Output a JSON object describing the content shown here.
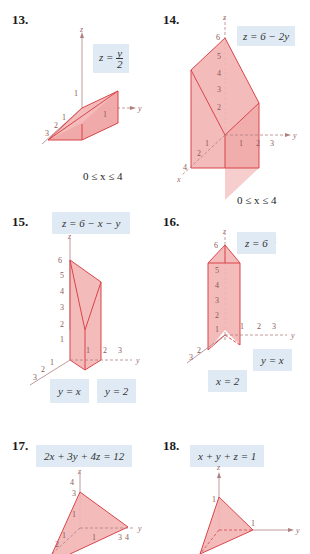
{
  "problems": [
    {
      "number": "13.",
      "equation": "z = y/2",
      "eq_lhs": "z =",
      "eq_num": "y",
      "eq_den": "2",
      "constraints": [
        "0 ≤ x ≤ 4",
        "0 ≤ y ≤ 2"
      ],
      "axes": {
        "x": "x",
        "y": "y",
        "z": "z"
      },
      "ticks": {
        "x": [
          "1",
          "2",
          "3",
          "4"
        ],
        "y": [
          "1"
        ],
        "z": [
          "1"
        ]
      }
    },
    {
      "number": "14.",
      "equation": "z = 6 − 2y",
      "constraints": [
        "0 ≤ x ≤ 4",
        "0 ≤ y ≤ 2"
      ],
      "axes": {
        "x": "x",
        "y": "y",
        "z": "z"
      },
      "ticks": {
        "x": [
          "1",
          "2",
          "4"
        ],
        "y": [
          "1",
          "2",
          "3"
        ],
        "z": [
          "2",
          "3",
          "4",
          "5",
          "6"
        ]
      }
    },
    {
      "number": "15.",
      "equation": "z = 6 − x − y",
      "labels": [
        "y = x",
        "y = 2"
      ],
      "axes": {
        "x": "x",
        "y": "y",
        "z": "z"
      },
      "ticks": {
        "x": [
          "1",
          "2",
          "3"
        ],
        "y": [
          "1",
          "2",
          "3"
        ],
        "z": [
          "1",
          "2",
          "3",
          "4",
          "5",
          "6"
        ]
      }
    },
    {
      "number": "16.",
      "equation": "z = 6",
      "labels": [
        "y = x",
        "x = 2"
      ],
      "axes": {
        "x": "x",
        "y": "y",
        "z": "z"
      },
      "ticks": {
        "x": [
          "2",
          "3"
        ],
        "y": [
          "1",
          "2",
          "3"
        ],
        "z": [
          "1",
          "2",
          "3",
          "4",
          "5",
          "6"
        ]
      }
    },
    {
      "number": "17.",
      "equation": "2x + 3y + 4z = 12",
      "axes": {
        "x": "x",
        "y": "y",
        "z": "z"
      },
      "ticks": {
        "x": [
          "1",
          "2"
        ],
        "y": [
          "1",
          "3",
          "4"
        ],
        "z": [
          "1",
          "3",
          "4"
        ]
      }
    },
    {
      "number": "18.",
      "equation": "x + y + z = 1",
      "axes": {
        "x": "x",
        "y": "y",
        "z": "z"
      },
      "ticks": {
        "x": [],
        "y": [
          "1"
        ],
        "z": [
          "1"
        ]
      }
    }
  ],
  "colors": {
    "fill": "#f3b4b4",
    "edge": "#d9454a",
    "box": "#dfeaf4",
    "axis": "#b08080"
  }
}
